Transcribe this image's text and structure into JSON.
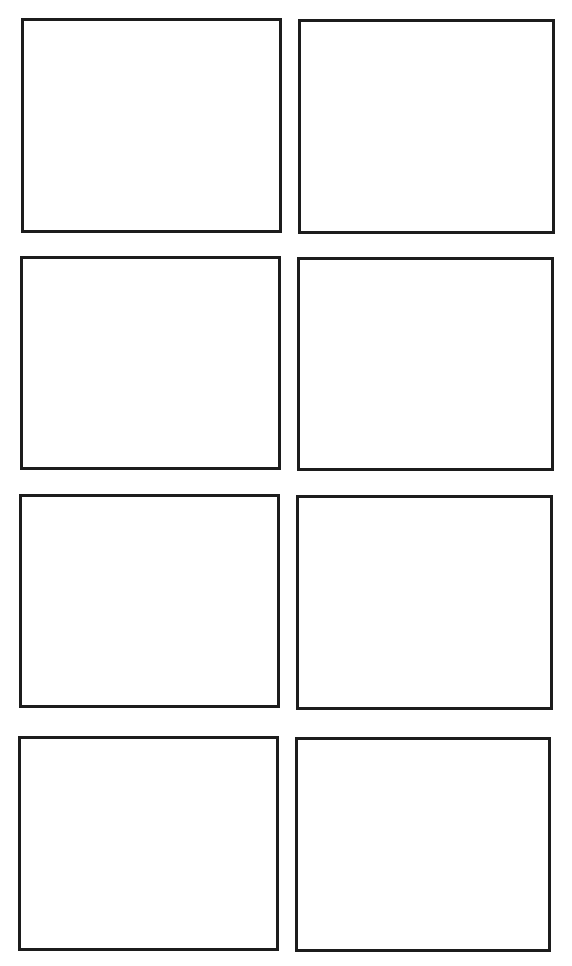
{
  "page": {
    "type": "blank-panel-template",
    "layout": {
      "columns": 2,
      "rows": 4
    },
    "border_color": "#1c1c1c",
    "background_color": "#ffffff",
    "panels": [
      {
        "id": "r1c1",
        "row": 1,
        "col": 1,
        "label": "",
        "x": 21,
        "y": 18,
        "w": 261,
        "h": 215
      },
      {
        "id": "r1c2",
        "row": 1,
        "col": 2,
        "label": "",
        "x": 298,
        "y": 19,
        "w": 257,
        "h": 215
      },
      {
        "id": "r2c1",
        "row": 2,
        "col": 1,
        "label": "",
        "x": 20,
        "y": 256,
        "w": 261,
        "h": 214
      },
      {
        "id": "r2c2",
        "row": 2,
        "col": 2,
        "label": "",
        "x": 297,
        "y": 257,
        "w": 257,
        "h": 214
      },
      {
        "id": "r3c1",
        "row": 3,
        "col": 1,
        "label": "",
        "x": 19,
        "y": 494,
        "w": 261,
        "h": 214
      },
      {
        "id": "r3c2",
        "row": 3,
        "col": 2,
        "label": "",
        "x": 296,
        "y": 495,
        "w": 257,
        "h": 215
      },
      {
        "id": "r4c1",
        "row": 4,
        "col": 1,
        "label": "",
        "x": 18,
        "y": 736,
        "w": 261,
        "h": 215
      },
      {
        "id": "r4c2",
        "row": 4,
        "col": 2,
        "label": "",
        "x": 295,
        "y": 737,
        "w": 256,
        "h": 215
      }
    ]
  }
}
